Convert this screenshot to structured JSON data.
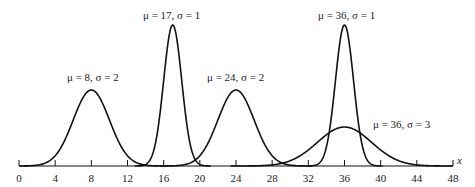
{
  "chart_data": {
    "type": "line",
    "title": "",
    "xlabel": "x",
    "ylabel": "",
    "xlim": [
      0,
      48
    ],
    "x_ticks": [
      0,
      4,
      8,
      12,
      16,
      20,
      24,
      28,
      32,
      36,
      40,
      44,
      48
    ],
    "x_tick_labels": [
      "0",
      "4",
      "8",
      "12",
      "16",
      "20",
      "24",
      "28",
      "32",
      "36",
      "40",
      "44",
      "48"
    ],
    "grid": false,
    "legend": "none (curves labeled inline)",
    "series": [
      {
        "name": "μ = 8, σ = 2",
        "mu": 8,
        "sigma": 2
      },
      {
        "name": "μ = 17, σ = 1",
        "mu": 17,
        "sigma": 1
      },
      {
        "name": "μ = 24, σ = 2",
        "mu": 24,
        "sigma": 2
      },
      {
        "name": "μ = 36, σ = 1",
        "mu": 36,
        "sigma": 1
      },
      {
        "name": "μ = 36, σ = 3",
        "mu": 36,
        "sigma": 3
      }
    ]
  },
  "labels": {
    "c1": "μ = 8, σ = 2",
    "c2": "μ = 17, σ = 1",
    "c3": "μ = 24, σ = 2",
    "c4": "μ = 36, σ = 1",
    "c5": "μ = 36, σ = 3",
    "axis": "x"
  },
  "ticks": [
    "0",
    "4",
    "8",
    "12",
    "16",
    "20",
    "24",
    "28",
    "32",
    "36",
    "40",
    "44",
    "48"
  ]
}
